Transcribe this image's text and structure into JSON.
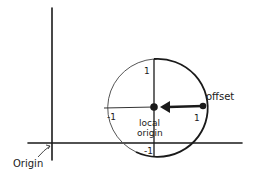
{
  "diagram": {
    "type": "coordinate-system-diagram",
    "global_axes": {
      "origin_label": "Origin"
    },
    "local_circle": {
      "center_label_line1": "local",
      "center_label_line2": "origin",
      "ticks": {
        "top": "1",
        "left": "-1",
        "right": "1",
        "bottom": "-1"
      }
    },
    "offset": {
      "label": "offset"
    },
    "colors": {
      "ink": "#1a1a1a",
      "thin_ink": "#333333",
      "background": "#ffffff"
    }
  }
}
